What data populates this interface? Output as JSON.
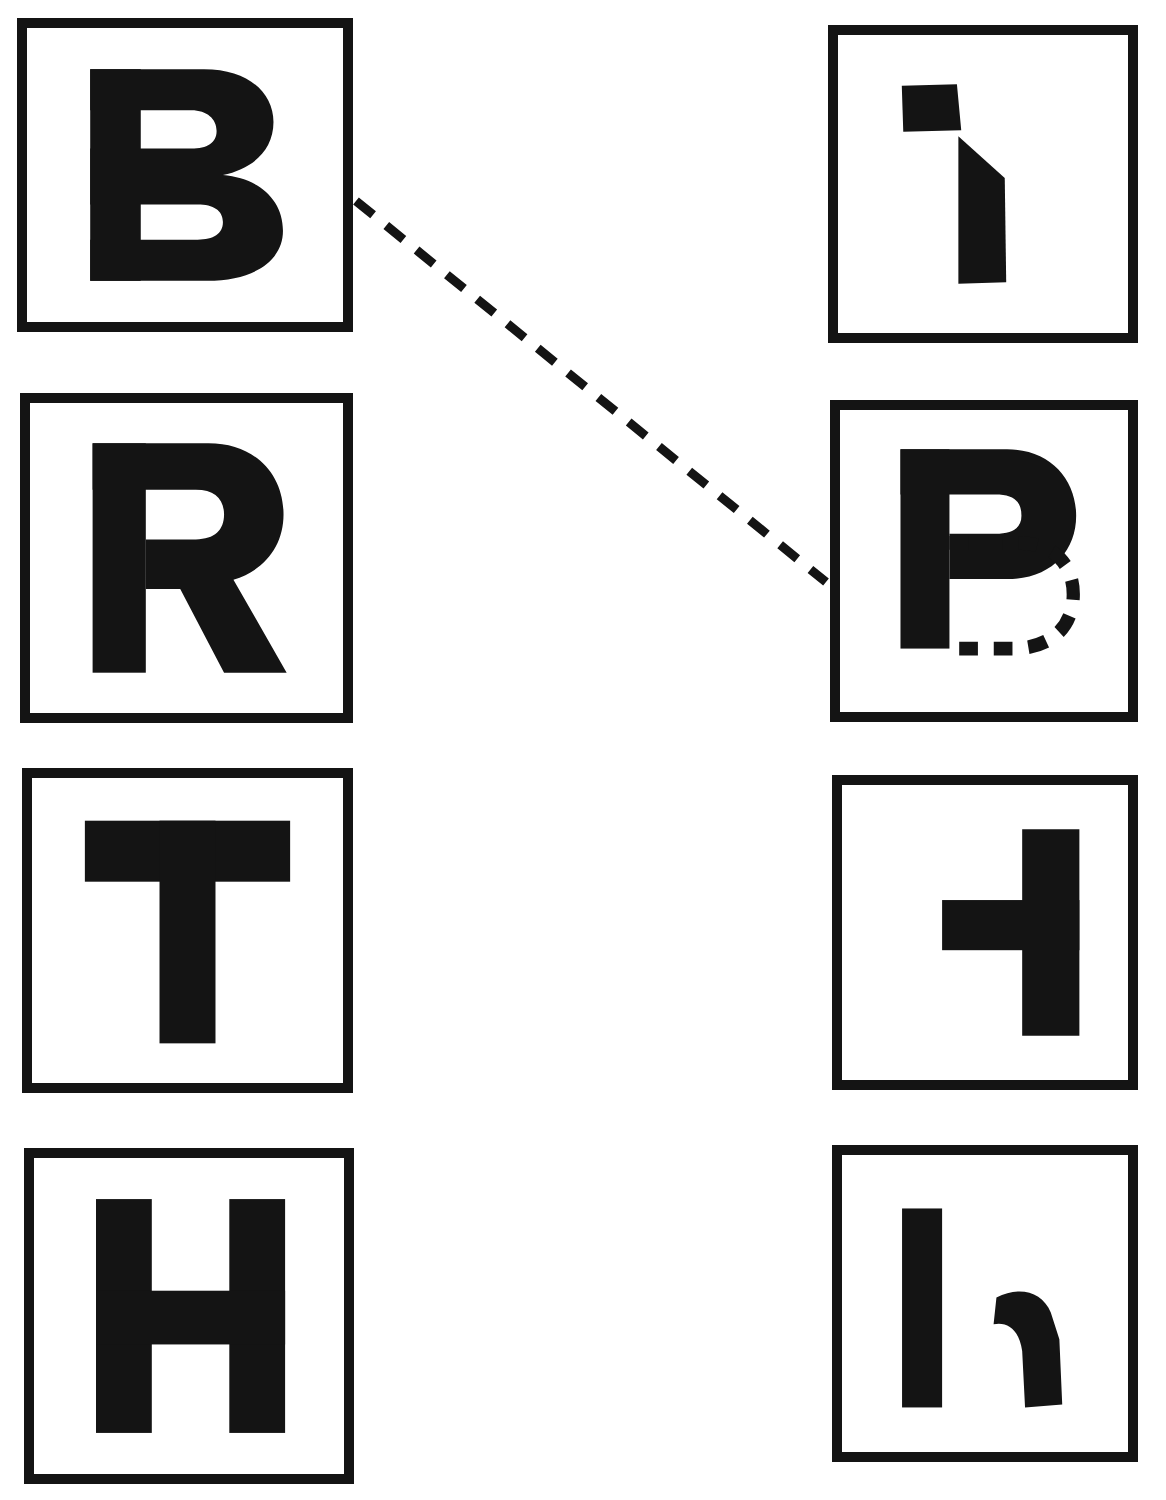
{
  "figure": {
    "title": "Letter recognition matching figure",
    "background_color": "#ffffff",
    "ink_color": "#141414",
    "width": 1166,
    "height": 1500,
    "box_border_width": 10
  },
  "left_column": {
    "name": "complete-letters-column",
    "items": [
      {
        "id": "left-box-1",
        "letter": "B",
        "description": "complete capital letter B",
        "x": 17,
        "y": 18,
        "width": 336,
        "height": 314,
        "glyph_type": "letter",
        "glyph_x": 0.2,
        "glyph_y": 0.11,
        "glyph_size": 0.8
      },
      {
        "id": "left-box-2",
        "letter": "R",
        "description": "complete capital letter R",
        "x": 20,
        "y": 393,
        "width": 333,
        "height": 330,
        "glyph_type": "letter",
        "glyph_x": 0.2,
        "glyph_y": 0.1,
        "glyph_size": 0.8
      },
      {
        "id": "left-box-3",
        "letter": "T",
        "description": "complete capital letter T",
        "x": 22,
        "y": 768,
        "width": 331,
        "height": 325,
        "glyph_type": "letter",
        "glyph_x": 0.19,
        "glyph_y": 0.11,
        "glyph_size": 0.8
      },
      {
        "id": "left-box-4",
        "letter": "H",
        "description": "complete capital letter H",
        "x": 24,
        "y": 1148,
        "width": 330,
        "height": 336,
        "glyph_type": "letter",
        "glyph_x": 0.2,
        "glyph_y": 0.11,
        "glyph_size": 0.8
      }
    ]
  },
  "right_column": {
    "name": "transformed-letters-column",
    "items": [
      {
        "id": "right-box-1",
        "letter": "I",
        "description": "fragmented letter: small quadrilateral above a tall bar with slanted top-right edge",
        "x": 828,
        "y": 25,
        "width": 310,
        "height": 318,
        "glyph_type": "fragment-i"
      },
      {
        "id": "right-box-2",
        "letter": "B",
        "description": "solid capital P with lower bowl drawn as dashed outline, completing a B",
        "x": 830,
        "y": 400,
        "width": 308,
        "height": 322,
        "glyph_type": "dashed-b"
      },
      {
        "id": "right-box-3",
        "letter": "T",
        "description": "capital T rotated 90 degrees clockwise",
        "x": 832,
        "y": 775,
        "width": 306,
        "height": 315,
        "glyph_type": "rotated-t"
      },
      {
        "id": "right-box-4",
        "letter": "H",
        "description": "fragmented letter: tall vertical bar beside a curved hook stroke",
        "x": 832,
        "y": 1145,
        "width": 306,
        "height": 317,
        "glyph_type": "fragment-h"
      }
    ]
  },
  "connector": {
    "name": "dashed-match-line",
    "description": "dashed diagonal line linking the left B box to the right dashed-B box",
    "from_box": "left-box-1",
    "to_box": "right-box-2",
    "x1": 356,
    "y1": 201,
    "x2": 826,
    "y2": 582,
    "dash_length": 22,
    "dash_gap": 17,
    "stroke_width": 9,
    "color": "#141414"
  }
}
